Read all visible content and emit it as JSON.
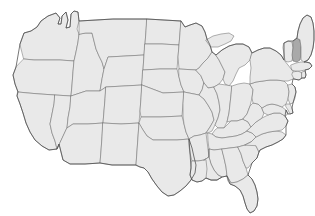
{
  "map": {
    "title": "United States Map",
    "type": "choropleth",
    "background_color": "#ffffff",
    "default_state_fill": "#e9e9e9",
    "highlight_fill": "#a9a9a9",
    "border_color": "#6f6f6f",
    "outline_color": "#4a4a4a",
    "projection": "albers-usa",
    "has_labels": false,
    "has_legend": false,
    "has_title_text": false,
    "highlighted_states": [
      "New Hampshire"
    ],
    "highlighted_count": 1,
    "state_count": 49,
    "includes_alaska": false,
    "includes_hawaii": false,
    "states": [
      {
        "code": "WA",
        "name": "Washington",
        "highlighted": false
      },
      {
        "code": "OR",
        "name": "Oregon",
        "highlighted": false
      },
      {
        "code": "CA",
        "name": "California",
        "highlighted": false
      },
      {
        "code": "NV",
        "name": "Nevada",
        "highlighted": false
      },
      {
        "code": "ID",
        "name": "Idaho",
        "highlighted": false
      },
      {
        "code": "MT",
        "name": "Montana",
        "highlighted": false
      },
      {
        "code": "WY",
        "name": "Wyoming",
        "highlighted": false
      },
      {
        "code": "UT",
        "name": "Utah",
        "highlighted": false
      },
      {
        "code": "AZ",
        "name": "Arizona",
        "highlighted": false
      },
      {
        "code": "CO",
        "name": "Colorado",
        "highlighted": false
      },
      {
        "code": "NM",
        "name": "New Mexico",
        "highlighted": false
      },
      {
        "code": "ND",
        "name": "North Dakota",
        "highlighted": false
      },
      {
        "code": "SD",
        "name": "South Dakota",
        "highlighted": false
      },
      {
        "code": "NE",
        "name": "Nebraska",
        "highlighted": false
      },
      {
        "code": "KS",
        "name": "Kansas",
        "highlighted": false
      },
      {
        "code": "OK",
        "name": "Oklahoma",
        "highlighted": false
      },
      {
        "code": "TX",
        "name": "Texas",
        "highlighted": false
      },
      {
        "code": "MN",
        "name": "Minnesota",
        "highlighted": false
      },
      {
        "code": "IA",
        "name": "Iowa",
        "highlighted": false
      },
      {
        "code": "MO",
        "name": "Missouri",
        "highlighted": false
      },
      {
        "code": "AR",
        "name": "Arkansas",
        "highlighted": false
      },
      {
        "code": "LA",
        "name": "Louisiana",
        "highlighted": false
      },
      {
        "code": "WI",
        "name": "Wisconsin",
        "highlighted": false
      },
      {
        "code": "IL",
        "name": "Illinois",
        "highlighted": false
      },
      {
        "code": "MS",
        "name": "Mississippi",
        "highlighted": false
      },
      {
        "code": "MI",
        "name": "Michigan",
        "highlighted": false
      },
      {
        "code": "IN",
        "name": "Indiana",
        "highlighted": false
      },
      {
        "code": "OH",
        "name": "Ohio",
        "highlighted": false
      },
      {
        "code": "KY",
        "name": "Kentucky",
        "highlighted": false
      },
      {
        "code": "TN",
        "name": "Tennessee",
        "highlighted": false
      },
      {
        "code": "AL",
        "name": "Alabama",
        "highlighted": false
      },
      {
        "code": "GA",
        "name": "Georgia",
        "highlighted": false
      },
      {
        "code": "FL",
        "name": "Florida",
        "highlighted": false
      },
      {
        "code": "SC",
        "name": "South Carolina",
        "highlighted": false
      },
      {
        "code": "NC",
        "name": "North Carolina",
        "highlighted": false
      },
      {
        "code": "VA",
        "name": "Virginia",
        "highlighted": false
      },
      {
        "code": "WV",
        "name": "West Virginia",
        "highlighted": false
      },
      {
        "code": "MD",
        "name": "Maryland",
        "highlighted": false
      },
      {
        "code": "DE",
        "name": "Delaware",
        "highlighted": false
      },
      {
        "code": "PA",
        "name": "Pennsylvania",
        "highlighted": false
      },
      {
        "code": "NJ",
        "name": "New Jersey",
        "highlighted": false
      },
      {
        "code": "NY",
        "name": "New York",
        "highlighted": false
      },
      {
        "code": "CT",
        "name": "Connecticut",
        "highlighted": false
      },
      {
        "code": "RI",
        "name": "Rhode Island",
        "highlighted": false
      },
      {
        "code": "MA",
        "name": "Massachusetts",
        "highlighted": false
      },
      {
        "code": "VT",
        "name": "Vermont",
        "highlighted": false
      },
      {
        "code": "NH",
        "name": "New Hampshire",
        "highlighted": true
      },
      {
        "code": "ME",
        "name": "Maine",
        "highlighted": false
      }
    ]
  }
}
